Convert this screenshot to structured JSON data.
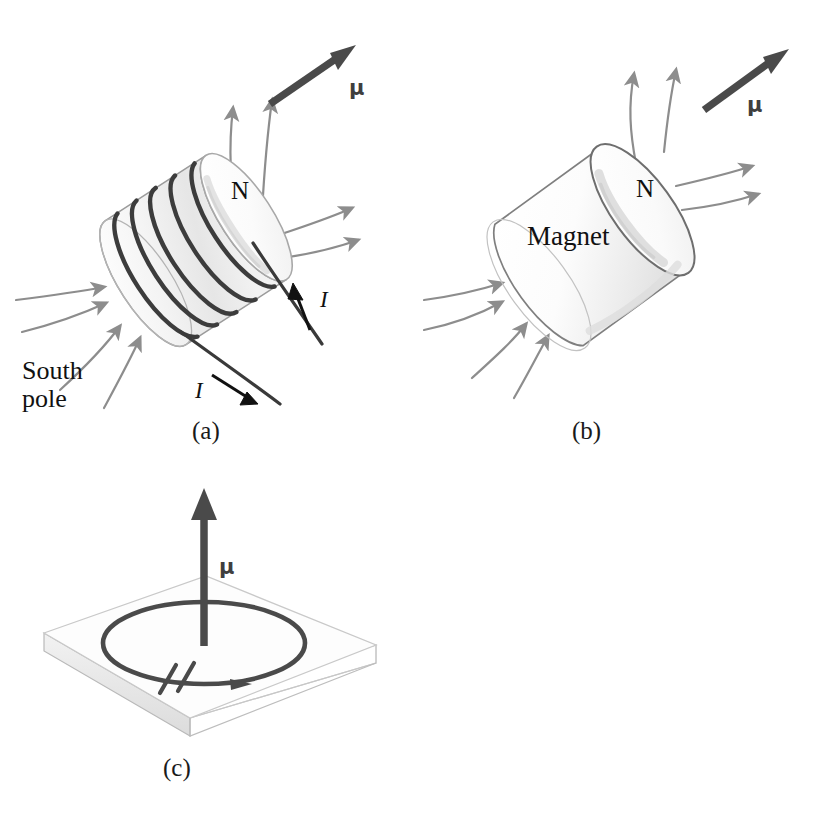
{
  "figure": {
    "panels": [
      {
        "id": "a",
        "caption": "(a)",
        "object": "solenoid",
        "labels": {
          "moment": "μ",
          "north": "N",
          "south": "South\npole",
          "south_line1": "South",
          "south_line2": "pole",
          "current_upper": "I",
          "current_lower": "I"
        },
        "coil_turns": 5,
        "field_lines_out": 4,
        "field_lines_in": 4
      },
      {
        "id": "b",
        "caption": "(b)",
        "object": "bar-magnet",
        "labels": {
          "moment": "μ",
          "north": "N",
          "body": "Magnet"
        },
        "field_lines_out": 4,
        "field_lines_in": 4
      },
      {
        "id": "c",
        "caption": "(c)",
        "object": "current-loop-on-plate",
        "labels": {
          "moment": "μ"
        }
      }
    ],
    "colors": {
      "field_line": "#8d8d8d",
      "moment_arrow": "#4a4a4a",
      "coil_wire": "#3c3c3c",
      "loop_wire": "#4a4a4a",
      "outline": "#8f8f8f",
      "magnet_outline": "#6e6e6e",
      "shading_light": "#f7f7f7",
      "shading_mid": "#ebebeb",
      "plate_top": "#fcfcfc",
      "plate_edge": "#e3e3e3",
      "text": "#111111",
      "background": "#ffffff"
    }
  }
}
